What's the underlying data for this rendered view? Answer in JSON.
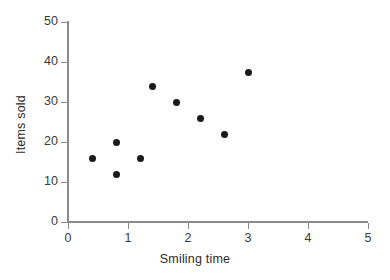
{
  "chart_data": {
    "type": "scatter",
    "title": "",
    "xlabel": "Smiling time",
    "ylabel": "Items sold",
    "xlim": [
      0,
      5
    ],
    "ylim": [
      0,
      50
    ],
    "xticks": [
      "0",
      "1",
      "2",
      "3",
      "4",
      "5"
    ],
    "yticks": [
      "0",
      "10",
      "20",
      "30",
      "40",
      "50"
    ],
    "xtick_values": [
      0,
      1,
      2,
      3,
      4,
      5
    ],
    "ytick_values": [
      0,
      10,
      20,
      30,
      40,
      50
    ],
    "grid": false,
    "legend": false,
    "marker": "filled-circle",
    "marker_color": "#1a1a1a",
    "axis_color": "#8a8a8a",
    "background": "#ffffff",
    "points": [
      {
        "x": 0.4,
        "y": 16
      },
      {
        "x": 0.8,
        "y": 20
      },
      {
        "x": 0.8,
        "y": 12
      },
      {
        "x": 1.2,
        "y": 16
      },
      {
        "x": 1.4,
        "y": 34
      },
      {
        "x": 1.8,
        "y": 30
      },
      {
        "x": 2.2,
        "y": 26
      },
      {
        "x": 2.6,
        "y": 22
      },
      {
        "x": 3.0,
        "y": 37.5
      }
    ]
  }
}
